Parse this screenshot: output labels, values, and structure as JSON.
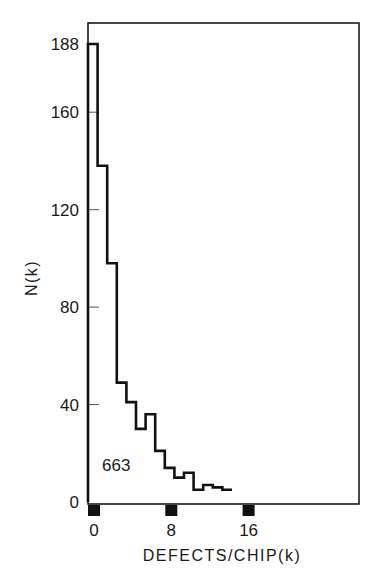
{
  "chart_data": {
    "type": "bar",
    "subtype": "step-histogram",
    "title": "",
    "xlabel": "DEFECTS/CHIP (k)",
    "ylabel": "N(k)",
    "x": [
      0,
      1,
      2,
      3,
      4,
      5,
      6,
      7,
      8,
      9,
      10,
      11,
      12,
      13,
      14
    ],
    "values": [
      188,
      138,
      98,
      49,
      41,
      30,
      36,
      21,
      14,
      10,
      12,
      5,
      7,
      6,
      5
    ],
    "xlim": [
      0,
      28
    ],
    "ylim": [
      0,
      196
    ],
    "yticks": [
      0,
      40,
      80,
      120,
      160,
      188
    ],
    "xticks": [
      0,
      8,
      16
    ],
    "annotations": [
      {
        "text": "663",
        "x": 1.5,
        "y": 15
      }
    ],
    "grid": false,
    "legend": null
  },
  "labels": {
    "ylabel": "N(k)",
    "xlabel": "DEFECTS/CHIP(k)",
    "annotation": "663",
    "yticks": [
      "188",
      "160",
      "120",
      "80",
      "40",
      "0"
    ],
    "xticks": [
      "0",
      "8",
      "16"
    ]
  }
}
